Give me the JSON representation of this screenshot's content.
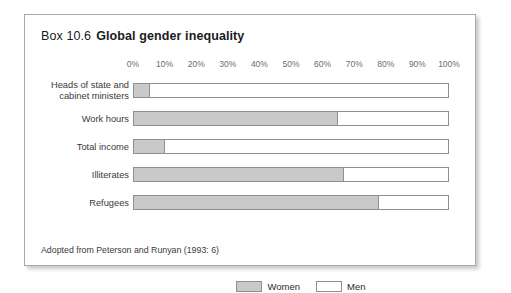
{
  "box": {
    "number": "Box 10.6",
    "title": "Global gender inequality",
    "source_note": "Adopted from Peterson and Runyan (1993: 6)"
  },
  "legend": {
    "women_label": "Women",
    "men_label": "Men"
  },
  "colors": {
    "women_fill": "#c9c9c9",
    "men_fill": "#ffffff",
    "bar_stroke": "#8f8f8f",
    "box_border": "#a8a8a8",
    "tick_text": "#6d6d6d"
  },
  "chart_data": {
    "type": "bar",
    "orientation": "horizontal",
    "stacked": true,
    "title": "Global gender inequality",
    "xlabel": "",
    "ylabel": "",
    "xlim": [
      0,
      100
    ],
    "grid": false,
    "legend_position": "bottom",
    "tick_labels": [
      "0%",
      "10%",
      "20%",
      "30%",
      "40%",
      "50%",
      "60%",
      "70%",
      "80%",
      "90%",
      "100%"
    ],
    "tick_values": [
      0,
      10,
      20,
      30,
      40,
      50,
      60,
      70,
      80,
      90,
      100
    ],
    "categories": [
      "Heads of state and cabinet ministers",
      "Work hours",
      "Total income",
      "Illiterates",
      "Refugees"
    ],
    "category_lines": [
      [
        "Heads of state and",
        "cabinet ministers"
      ],
      [
        "Work hours",
        ""
      ],
      [
        "Total income",
        ""
      ],
      [
        "Illiterates",
        ""
      ],
      [
        "Refugees",
        ""
      ]
    ],
    "series": [
      {
        "name": "Women",
        "values": [
          5,
          65,
          10,
          67,
          78
        ]
      },
      {
        "name": "Men",
        "values": [
          95,
          35,
          90,
          33,
          22
        ]
      }
    ]
  }
}
